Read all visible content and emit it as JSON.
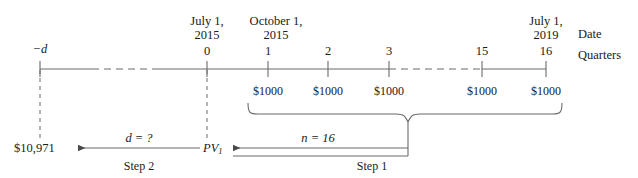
{
  "diagram": {
    "type": "financial-timeline",
    "title_axis_labels": {
      "date_label": "Date",
      "quarters_label": "Quarters"
    },
    "timeline": {
      "left_end_label": "−d",
      "ticks": [
        {
          "quarter": "0",
          "date_line1": "July 1,",
          "date_line2": "2015"
        },
        {
          "quarter": "1",
          "date_line1": "October 1,",
          "date_line2": "2015"
        },
        {
          "quarter": "2",
          "date_line1": "",
          "date_line2": ""
        },
        {
          "quarter": "3",
          "date_line1": "",
          "date_line2": ""
        },
        {
          "quarter": "15",
          "date_line1": "",
          "date_line2": ""
        },
        {
          "quarter": "16",
          "date_line1": "July 1,",
          "date_line2": "2019"
        }
      ]
    },
    "payments": [
      {
        "at_quarter": "1",
        "amount": "$1000"
      },
      {
        "at_quarter": "2",
        "amount": "$1000"
      },
      {
        "at_quarter": "3",
        "amount": "$1000"
      },
      {
        "at_quarter": "15",
        "amount": "$1000"
      },
      {
        "at_quarter": "16",
        "amount": "$1000"
      }
    ],
    "annotations": {
      "principal_value": "$10,971",
      "present_value": "PV",
      "present_value_subscript": "1",
      "step1_label": "Step 1",
      "step1_value": "n = 16",
      "step2_label": "Step 2",
      "step2_value": "d = ?"
    },
    "colors": {
      "line": "#6b6b6b",
      "text": "#1a1a1a",
      "background": "#ffffff"
    }
  }
}
